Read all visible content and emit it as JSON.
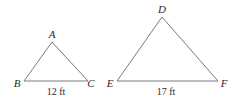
{
  "diagram": {
    "triangles": [
      {
        "name": "ABC",
        "vertices": {
          "A": {
            "label": "A",
            "x": 52,
            "y": 42,
            "lx": 52,
            "ly": 38
          },
          "B": {
            "label": "B",
            "x": 24,
            "y": 81,
            "lx": 17,
            "ly": 87
          },
          "C": {
            "label": "C",
            "x": 88,
            "y": 81,
            "lx": 91,
            "ly": 87
          }
        },
        "base_measure": {
          "text": "12 ft",
          "x": 56,
          "y": 95
        }
      },
      {
        "name": "DEF",
        "vertices": {
          "D": {
            "label": "D",
            "x": 162,
            "y": 17,
            "lx": 162,
            "ly": 13
          },
          "E": {
            "label": "E",
            "x": 117,
            "y": 81,
            "lx": 110,
            "ly": 87
          },
          "F": {
            "label": "F",
            "x": 218,
            "y": 81,
            "lx": 224,
            "ly": 87
          }
        },
        "base_measure": {
          "text": "17 ft",
          "x": 166,
          "y": 95
        }
      }
    ],
    "colors": {
      "edge": "#7a7a7a",
      "text": "#2a2a2a",
      "background": "#ffffff"
    }
  }
}
